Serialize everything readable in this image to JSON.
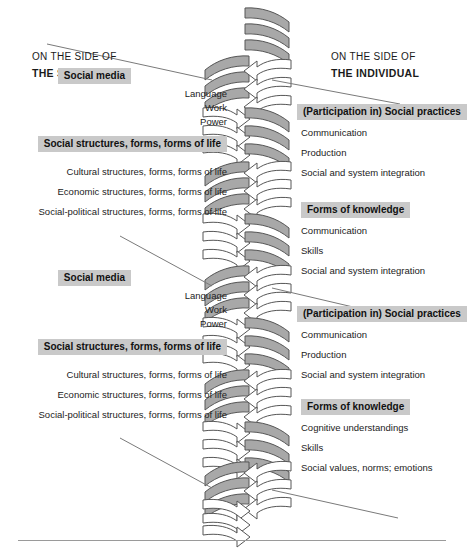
{
  "figure": {
    "type": "double-helix-spiral-diagram",
    "background": "#ffffff",
    "arc_fill": "#a8a8a8",
    "arc_stroke": "#555555",
    "arrow_fill": "#ffffff",
    "arrow_stroke": "#555555",
    "label_box_bg": "#c9c9c9",
    "text_color": "#1a1a1a"
  },
  "headers": {
    "left_line1": "ON THE SIDE OF",
    "left_line2": "THE SOCIAL",
    "right_line1": "ON THE SIDE OF",
    "right_line2": "THE INDIVIDUAL"
  },
  "left_blocks": [
    {
      "title": "Social media",
      "items": [
        "Language",
        "Work",
        "Power"
      ]
    },
    {
      "title": "Social structures, forms, forms of life",
      "items": [
        "Cultural structures, forms, forms of life",
        "Economic structures, forms, forms of life",
        "Social-political structures, forms, forms of life"
      ]
    },
    {
      "title": "Social media",
      "items": [
        "Language",
        "Work",
        "Power"
      ]
    },
    {
      "title": "Social structures, forms, forms of life",
      "items": [
        "Cultural structures, forms, forms of life",
        "Economic structures, forms, forms of life",
        "Social-political structures, forms, forms of life"
      ]
    }
  ],
  "right_blocks": [
    {
      "title": "(Participation in) Social practices",
      "items": [
        "Communication",
        "Production",
        "Social and system integration"
      ]
    },
    {
      "title": "Forms of knowledge",
      "items": [
        "Communication",
        "Skills",
        "Social and system integration"
      ]
    },
    {
      "title": "(Participation in) Social practices",
      "items": [
        "Communication",
        "Production",
        "Social and system integration"
      ]
    },
    {
      "title": "Forms of knowledge",
      "items": [
        "Cognitive understandings",
        "Skills",
        "Social values, norms; emotions"
      ]
    }
  ]
}
